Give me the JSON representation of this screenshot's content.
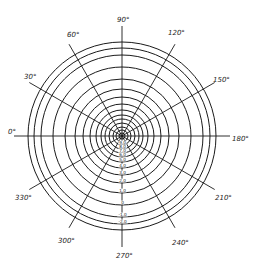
{
  "diagram": {
    "type": "polar-grid",
    "center": {
      "x": 122,
      "y": 136
    },
    "ring_radii": [
      3,
      6,
      9,
      13,
      17,
      21,
      26,
      32,
      39,
      47,
      57,
      69,
      81,
      88,
      94
    ],
    "angle_orientation": "0° at left, increasing clockwise (90° at top, 180° at right, 270° at bottom)",
    "spokes": [
      {
        "angle": 0,
        "label": "0°",
        "length": 108,
        "label_pos": {
          "x": 8,
          "y": 134
        }
      },
      {
        "angle": 30,
        "label": "30°",
        "length": 107,
        "label_pos": {
          "x": 24,
          "y": 79
        }
      },
      {
        "angle": 60,
        "label": "60°",
        "length": 106,
        "label_pos": {
          "x": 67,
          "y": 37
        }
      },
      {
        "angle": 90,
        "label": "90°",
        "length": 110,
        "label_pos": {
          "x": 117,
          "y": 22
        }
      },
      {
        "angle": 120,
        "label": "120°",
        "length": 106,
        "label_pos": {
          "x": 168,
          "y": 35
        }
      },
      {
        "angle": 150,
        "label": "150°",
        "length": 107,
        "label_pos": {
          "x": 213,
          "y": 82
        }
      },
      {
        "angle": 180,
        "label": "180°",
        "length": 108,
        "label_pos": {
          "x": 232,
          "y": 141
        }
      },
      {
        "angle": 210,
        "label": "210°",
        "length": 107,
        "label_pos": {
          "x": 215,
          "y": 200
        }
      },
      {
        "angle": 240,
        "label": "240°",
        "length": 106,
        "label_pos": {
          "x": 172,
          "y": 245
        }
      },
      {
        "angle": 270,
        "label": "270°",
        "length": 111,
        "label_pos": {
          "x": 116,
          "y": 258
        }
      },
      {
        "angle": 300,
        "label": "300°",
        "length": 106,
        "label_pos": {
          "x": 58,
          "y": 243
        }
      },
      {
        "angle": 330,
        "label": "330°",
        "length": 107,
        "label_pos": {
          "x": 15,
          "y": 200
        }
      }
    ],
    "ring_labels": [
      {
        "text": "9.0",
        "r": 9
      },
      {
        "text": "8.0",
        "r": 13
      },
      {
        "text": "7.0",
        "r": 17
      },
      {
        "text": "6.0",
        "r": 21
      },
      {
        "text": "5.0",
        "r": 26
      },
      {
        "text": "4.0",
        "r": 32
      },
      {
        "text": "3.0",
        "r": 39
      },
      {
        "text": "2.0",
        "r": 47
      },
      {
        "text": "1.0",
        "r": 57
      },
      {
        "text": "0",
        "r": 69
      },
      {
        "text": "-1.0",
        "r": 81
      },
      {
        "text": "-2.0",
        "r": 88
      }
    ],
    "colors": {
      "line": "#1a1a1a",
      "text": "#222222",
      "background": "#ffffff"
    }
  }
}
